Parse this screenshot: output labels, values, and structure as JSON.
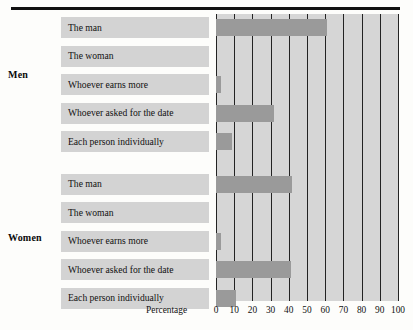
{
  "chart_data": {
    "type": "bar",
    "orientation": "horizontal",
    "title": "",
    "xlabel": "Percentage",
    "ylabel": "",
    "xlim": [
      0,
      100
    ],
    "xticks": [
      0,
      10,
      20,
      30,
      40,
      50,
      60,
      70,
      80,
      90,
      100
    ],
    "xticklabels": [
      "0",
      "10",
      "20",
      "30",
      "40",
      "50",
      "60",
      "70",
      "80",
      "90",
      "100"
    ],
    "grid": true,
    "legend": "none",
    "categories": [
      "The man",
      "The woman",
      "Whoever earns more",
      "Whoever asked for the date",
      "Each person individually"
    ],
    "groups": [
      {
        "name": "Men",
        "values": [
          61,
          0,
          3,
          32,
          9
        ],
        "bars": [
          {
            "category": "The man",
            "value": 61
          },
          {
            "category": "The woman",
            "value": 0
          },
          {
            "category": "Whoever earns more",
            "value": 3
          },
          {
            "category": "Whoever asked for the date",
            "value": 32
          },
          {
            "category": "Each person individually",
            "value": 9
          }
        ]
      },
      {
        "name": "Women",
        "values": [
          42,
          0,
          3,
          41,
          11
        ],
        "bars": [
          {
            "category": "The man",
            "value": 42
          },
          {
            "category": "The woman",
            "value": 0
          },
          {
            "category": "Whoever earns more",
            "value": 3
          },
          {
            "category": "Whoever asked for the date",
            "value": 41
          },
          {
            "category": "Each person individually",
            "value": 11
          }
        ]
      }
    ],
    "colors": {
      "bar": "#9a9a9a",
      "plot_background": "#d6d6d6",
      "label_band": "#d3d3d3",
      "gridline": "#232323",
      "rule": "#111111"
    }
  },
  "axis": {
    "title": "Percentage"
  },
  "groups": {
    "men_label": "Men",
    "women_label": "Women"
  },
  "rows": [
    {
      "label": "The man"
    },
    {
      "label": "The woman"
    },
    {
      "label": "Whoever earns more"
    },
    {
      "label": "Whoever asked for the date"
    },
    {
      "label": "Each person individually"
    },
    {
      "label": "The man"
    },
    {
      "label": "The woman"
    },
    {
      "label": "Whoever earns more"
    },
    {
      "label": "Whoever asked for the date"
    },
    {
      "label": "Each person individually"
    }
  ]
}
